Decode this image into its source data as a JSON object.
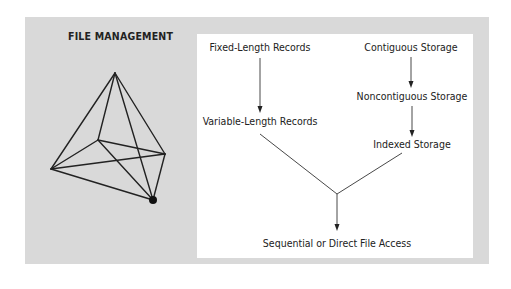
{
  "title": "FILE MANAGEMENT",
  "colors": {
    "panel_background": "#d9d9d9",
    "content_background": "#ffffff",
    "line": "#222222",
    "text": "#222222"
  },
  "icon": "pyramid-wireframe-icon",
  "flow": {
    "left_branch": [
      {
        "label": "Fixed-Length Records"
      },
      {
        "label": "Variable-Length Records"
      }
    ],
    "right_branch": [
      {
        "label": "Contiguous Storage"
      },
      {
        "label": "Noncontiguous Storage"
      },
      {
        "label": "Indexed Storage"
      }
    ],
    "result": {
      "label": "Sequential or Direct File Access"
    }
  }
}
